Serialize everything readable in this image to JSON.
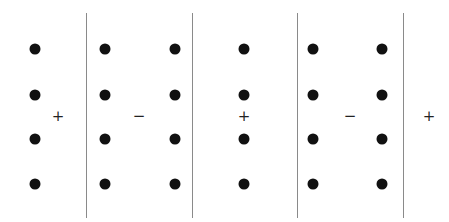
{
  "diagram": {
    "colors": {
      "dot": "#111111",
      "line": "#8a8a8a",
      "sign": "#222222"
    },
    "lines": [
      {
        "x": 86,
        "y1": 13,
        "y2": 218
      },
      {
        "x": 192,
        "y1": 13,
        "y2": 218
      },
      {
        "x": 297,
        "y1": 13,
        "y2": 218
      },
      {
        "x": 403,
        "y1": 13,
        "y2": 218
      }
    ],
    "dot_columns_x": [
      35,
      105,
      175,
      244,
      313,
      382
    ],
    "dot_rows_y": [
      49,
      95,
      139,
      184
    ],
    "signs": [
      {
        "label": "+",
        "x": 58,
        "y": 116
      },
      {
        "label": "−",
        "x": 139,
        "y": 116
      },
      {
        "label": "+",
        "x": 244,
        "y": 116
      },
      {
        "label": "−",
        "x": 350,
        "y": 116
      },
      {
        "label": "+",
        "x": 429,
        "y": 116
      }
    ]
  }
}
